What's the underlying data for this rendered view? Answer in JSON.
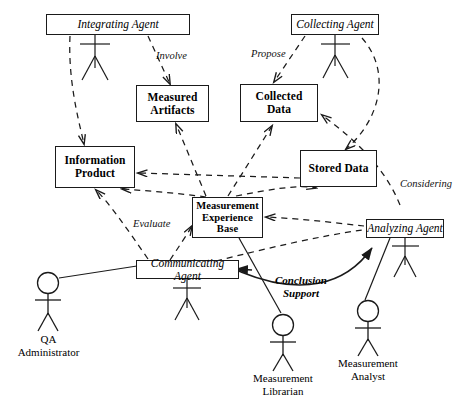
{
  "diagram": {
    "stroke_color": "#1a1a1a",
    "background_color": "#ffffff"
  },
  "entities": [
    {
      "id": "measured-artifacts",
      "label_line1": "Measured",
      "label_line2": "Artifacts"
    },
    {
      "id": "collected-data",
      "label_line1": "Collected",
      "label_line2": "Data"
    },
    {
      "id": "information-product",
      "label_line1": "Information",
      "label_line2": "Product"
    },
    {
      "id": "stored-data",
      "label_line1": "Stored Data",
      "label_line2": ""
    },
    {
      "id": "measurement-experience-base",
      "label_line1": "Measurement",
      "label_line2": "Experience",
      "label_line3": "Base"
    }
  ],
  "agents": [
    {
      "id": "integrating-agent",
      "label": "Integrating Agent"
    },
    {
      "id": "collecting-agent",
      "label": "Collecting Agent"
    },
    {
      "id": "analyzing-agent",
      "label": "Analyzing Agent"
    },
    {
      "id": "communicating-agent",
      "label": "Communicating Agent"
    }
  ],
  "actors": [
    {
      "id": "qa-administrator",
      "line1": "QA",
      "line2": "Administrator"
    },
    {
      "id": "measurement-librarian",
      "line1": "Measurement",
      "line2": "Librarian"
    },
    {
      "id": "measurement-analyst",
      "line1": "Measurement",
      "line2": "Analyst"
    }
  ],
  "edge_labels": [
    {
      "id": "involve",
      "text": "Involve"
    },
    {
      "id": "propose",
      "text": "Propose"
    },
    {
      "id": "evaluate",
      "text": "Evaluate"
    },
    {
      "id": "considering",
      "text": "Considering"
    },
    {
      "id": "conclusion-support",
      "line1": "Conclusion",
      "line2": "Support"
    }
  ]
}
